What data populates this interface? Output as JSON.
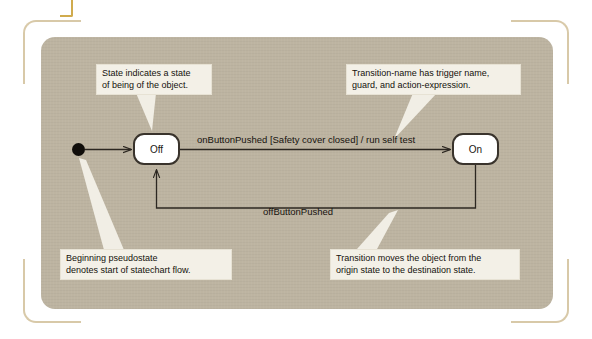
{
  "figure": {
    "type": "uml-statechart",
    "title": "",
    "panel_color": "#bdb4a1",
    "callout_color": "#f3f0e7",
    "bracket_color": "#d8c9a8",
    "state_border_color": "#39332c"
  },
  "diagram": {
    "pseudostate": {
      "name": "initial-pseudostate",
      "shape": "filled-circle"
    },
    "states": [
      {
        "id": "off",
        "label": "Off"
      },
      {
        "id": "on",
        "label": "On"
      }
    ],
    "transitions": [
      {
        "id": "initial-to-off",
        "from": "initial-pseudostate",
        "to": "off",
        "label": ""
      },
      {
        "id": "off-to-on",
        "from": "off",
        "to": "on",
        "label": "onButtonPushed [Safety cover closed] / run self test",
        "trigger": "onButtonPushed",
        "guard": "[Safety cover closed]",
        "action": "run self test"
      },
      {
        "id": "on-to-off",
        "from": "on",
        "to": "off",
        "label": "offButtonPushed",
        "trigger": "offButtonPushed",
        "guard": "",
        "action": ""
      }
    ]
  },
  "callouts": [
    {
      "id": "state-callout",
      "text": "State indicates a state\nof being of the object.",
      "points_to": "off"
    },
    {
      "id": "transition-name-callout",
      "text": "Transition-name has trigger name,\nguard, and action-expression.",
      "points_to": "off-to-on"
    },
    {
      "id": "pseudostate-callout",
      "text": "Beginning pseudostate\ndenotes start of statechart flow.",
      "points_to": "initial-pseudostate"
    },
    {
      "id": "transition-moves-callout",
      "text": "Transition moves the object from the\norigin state to the destination state.",
      "points_to": "on-to-off"
    }
  ]
}
